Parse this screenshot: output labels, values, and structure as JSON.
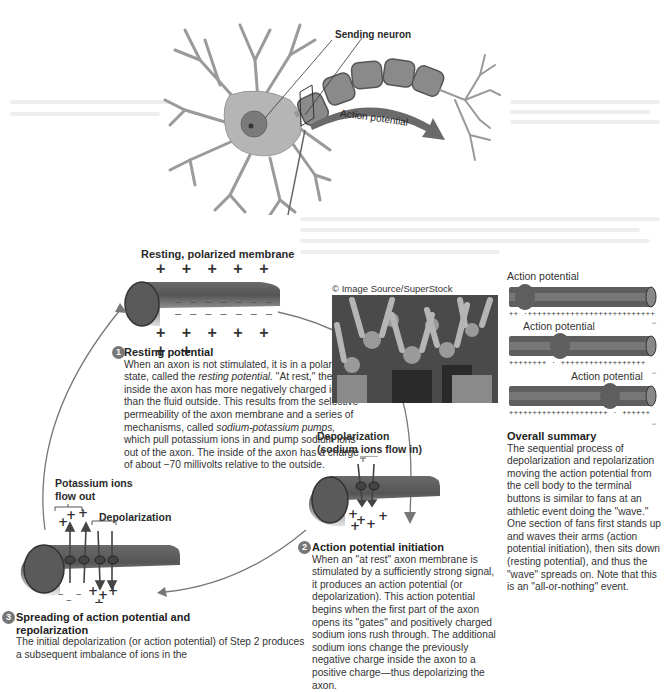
{
  "figure": {
    "top": {
      "sending_neuron_label": "Sending neuron",
      "action_potential_label": "Action potential"
    },
    "resting": {
      "title": "Resting, polarized membrane",
      "plus_top": "+ + + + + + +",
      "minus_inner_1": "– – – – – – –",
      "minus_inner_2": "– – – – – – –",
      "plus_bottom": "+ + + + + + +"
    },
    "photo": {
      "credit": "© Image Source/SuperStock",
      "alt": "Crowd of fans doing the wave"
    },
    "steps": [
      {
        "number": "1",
        "heading": "Resting potential",
        "body_pre": "When an axon is not stimulated, it is in a polarized state, called the ",
        "body_em": "resting potential.",
        "body_mid": " \"At rest,\" the fluid inside the axon has more negatively charged ions than the fluid outside. This results from the selective permeability of the axon membrane and a series of mechanisms, called ",
        "body_em2": "sodium-potassium pumps,",
        "body_post": " which pull potassium ions in and pump sodium ions out of the axon. The inside of the axon has a charge of about −70 millivolts relative to the outside."
      },
      {
        "number": "2",
        "heading": "Action potential initiation",
        "body": "When an \"at rest\" axon membrane is stimulated by a sufficiently strong signal, it produces an action potential (or depolarization). This action potential begins when the first part of the axon opens its \"gates\" and positively charged sodium ions rush through. The additional sodium ions change the previously negative charge inside the axon to a positive charge—thus depolarizing the axon."
      },
      {
        "number": "3",
        "heading": "Spreading of action potential and repolarization",
        "body": "The initial depolarization (or action potential) of Step 2 produces a subsequent imbalance of ions in the"
      }
    ],
    "depolarization": {
      "title_line1": "Depolarization",
      "title_line2": "(sodium ions flow in)"
    },
    "spreading": {
      "potassium_line1": "Potassium ions",
      "potassium_line2": "flow out",
      "depolarization_label": "Depolarization"
    },
    "summary_panels": {
      "labels": [
        "Action potential",
        "Action potential",
        "Action potential"
      ],
      "charges": [
        "++ ·+++++++++++++++++++++++++++",
        "++++++++ ·  ++++++++++++++++++",
        "+++++++++++++++++++++  · ++++++"
      ],
      "minus": "–"
    },
    "overall_summary": {
      "heading": "Overall summary",
      "body": "The sequential process of depolarization and repolarization moving the action potential from the cell body to the terminal buttons is similar to fans at an athletic event doing the \"wave.\" One section of fans first stands up and waves their arms (action potential initiation), then sits down (resting potential), and thus the \"wave\" spreads on. Note that this is an \"all-or-nothing\" event."
    },
    "colors": {
      "axon_dark": "#555555",
      "axon_mid": "#7a7a7a",
      "neuron_fill": "#b8b8b8",
      "arrow": "#666666",
      "text": "#333333"
    }
  }
}
